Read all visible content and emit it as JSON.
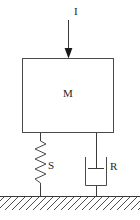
{
  "diagram": {
    "kind": "mass-spring-damper-schematic",
    "canvas": {
      "width": 140,
      "height": 220,
      "background": "#ffffff"
    },
    "colors": {
      "stroke": "#4a4a4a",
      "stroke_dark": "#3a3a3a",
      "arrowhead": "#1a1a1a",
      "hatch": "#4d4d4d",
      "label": "#1f1f1f",
      "background": "#ffffff"
    },
    "labels": {
      "force": "I",
      "mass": "M",
      "spring": "S",
      "damper": "R"
    },
    "components": {
      "force_arrow": {
        "icon_name": "down-arrow-icon",
        "x": 68,
        "y_start": 20,
        "y_end": 58
      },
      "mass_block": {
        "icon_name": "rectangle-mass-icon",
        "x": 22,
        "y": 58,
        "width": 92,
        "height": 75
      },
      "spring": {
        "icon_name": "zigzag-spring-icon",
        "x": 40,
        "y_top": 133,
        "y_bottom": 196,
        "zigzag_y_start": 141,
        "zigzag_y_end": 186,
        "amplitude": 6,
        "coil_count": 8
      },
      "damper": {
        "icon_name": "dashpot-damper-icon",
        "x": 96,
        "y_top": 133,
        "y_bottom": 196,
        "cylinder_left": 85,
        "cylinder_right": 107,
        "cylinder_top": 157,
        "cylinder_bottom": 186,
        "piston_y": 168,
        "piston_left": 88,
        "piston_right": 104
      },
      "ground": {
        "icon_name": "hatched-ground-icon",
        "y": 196,
        "x_start": 0,
        "x_end": 140,
        "hatch_depth": 13,
        "hatch_spacing": 7,
        "hatch_direction": "forward-slash"
      }
    }
  }
}
